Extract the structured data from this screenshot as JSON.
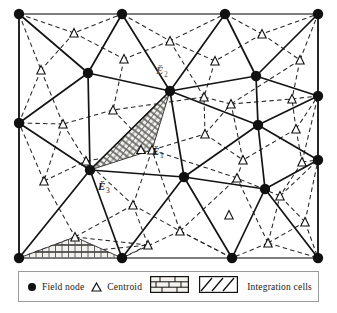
{
  "figure": {
    "type": "mesh-diagram",
    "frame": {
      "x": 19,
      "y": 14,
      "width": 299,
      "height": 244,
      "border_color": "#808080"
    }
  },
  "legend": {
    "items": [
      {
        "icon": "filled-circle-icon",
        "label": "Field node"
      },
      {
        "icon": "open-triangle-icon",
        "label": "Centroid"
      },
      {
        "icon": "brick-pattern-swatch",
        "label": ""
      },
      {
        "icon": "hatch-pattern-swatch",
        "label": "Integration cells"
      }
    ],
    "field_node_label": "Field node",
    "centroid_label": "Centroid",
    "integration_cells_label": "Integration cells"
  },
  "annotations": [
    {
      "id": "cell-1",
      "text": "Ē₁",
      "base": "E",
      "sub": "1",
      "x": 152,
      "y": 150,
      "marker": "open-triangle-icon"
    },
    {
      "id": "cell-2",
      "text": "Ē₂",
      "base": "E",
      "sub": "2",
      "x": 162,
      "y": 70,
      "marker": "none"
    },
    {
      "id": "cell-3",
      "text": "Ē₃",
      "base": "E",
      "sub": "3",
      "x": 103,
      "y": 186,
      "marker": "none"
    }
  ],
  "colors": {
    "node_fill": "#111111",
    "solid_edge": "#1a1a1a",
    "dashed_edge": "#2a2a2a",
    "frame": "#808080",
    "brick_fill": "#f0eeea",
    "hatch_fill": "#f2f0ec",
    "legend_border": "#9a9a9a"
  },
  "mesh": {
    "field_nodes": [
      [
        19,
        14
      ],
      [
        122,
        14
      ],
      [
        225,
        14
      ],
      [
        318,
        14
      ],
      [
        19,
        123
      ],
      [
        19,
        258
      ],
      [
        318,
        96
      ],
      [
        318,
        160
      ],
      [
        318,
        258
      ],
      [
        122,
        258
      ],
      [
        232,
        258
      ],
      [
        88,
        73
      ],
      [
        170,
        91
      ],
      [
        256,
        76
      ],
      [
        258,
        125
      ],
      [
        184,
        177
      ],
      [
        90,
        170
      ],
      [
        265,
        189
      ]
    ],
    "centroids": [
      [
        74,
        33
      ],
      [
        170,
        41
      ],
      [
        262,
        34
      ],
      [
        124,
        59
      ],
      [
        215,
        61
      ],
      [
        300,
        60
      ],
      [
        41,
        70
      ],
      [
        113,
        110
      ],
      [
        204,
        97
      ],
      [
        231,
        104
      ],
      [
        292,
        99
      ],
      [
        63,
        124
      ],
      [
        152,
        150
      ],
      [
        205,
        134
      ],
      [
        296,
        129
      ],
      [
        243,
        160
      ],
      [
        44,
        181
      ],
      [
        133,
        205
      ],
      [
        86,
        161
      ],
      [
        229,
        215
      ],
      [
        302,
        162
      ],
      [
        280,
        196
      ],
      [
        75,
        237
      ],
      [
        180,
        231
      ],
      [
        268,
        243
      ],
      [
        305,
        222
      ],
      [
        148,
        245
      ],
      [
        237,
        178
      ]
    ]
  },
  "shaded_cells": [
    {
      "id": "brick-cell",
      "pattern": "brick",
      "label": ""
    },
    {
      "id": "hatch-cell",
      "pattern": "hatch",
      "label": "Ē₁"
    }
  ]
}
